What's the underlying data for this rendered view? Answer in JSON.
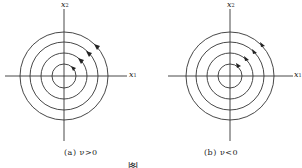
{
  "panels": [
    {
      "id": "a",
      "axis_x_label": "x",
      "axis_x_sub": "1",
      "axis_y_label": "x",
      "axis_y_sub": "2",
      "caption": "(a)  ν>0",
      "center": [
        64,
        76
      ],
      "radii": [
        12,
        23,
        34,
        44
      ],
      "direction": "counterclockwise"
    },
    {
      "id": "b",
      "axis_x_label": "x",
      "axis_x_sub": "1",
      "axis_y_label": "x",
      "axis_y_sub": "2",
      "caption": "(b)  ν<0",
      "center": [
        230,
        76
      ],
      "radii": [
        12,
        23,
        34,
        44
      ],
      "direction": "clockwise"
    }
  ],
  "figure_caption": "图 ..."
}
